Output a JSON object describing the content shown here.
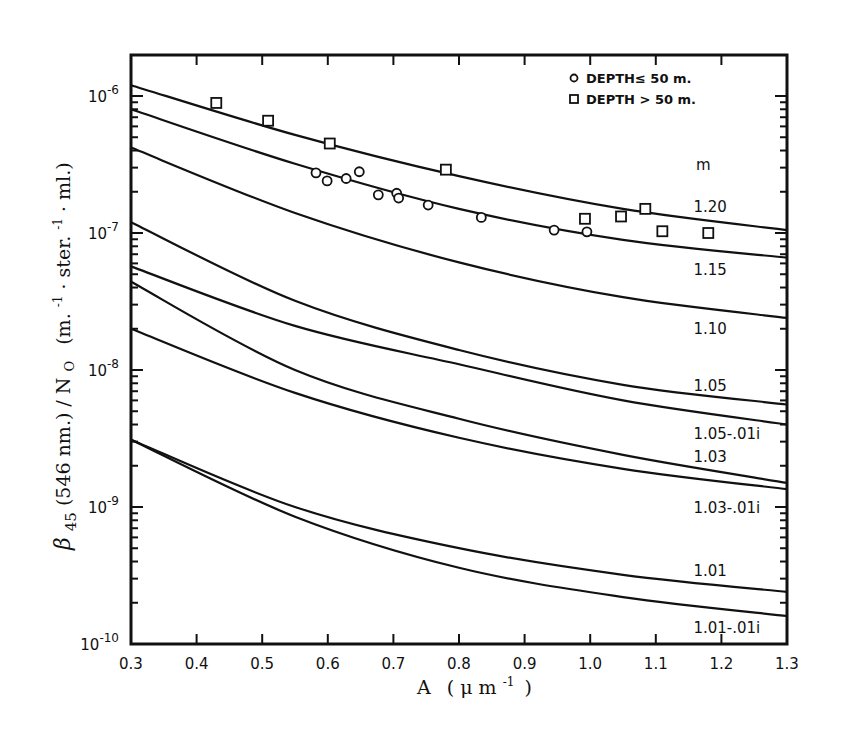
{
  "chart_data": {
    "type": "line",
    "title": "",
    "xlabel": "A (μm⁻¹)",
    "ylabel": "β₄₅(546nm.) / N₀ (m.⁻¹·ster.⁻¹·ml.)",
    "xlim": [
      0.3,
      1.3
    ],
    "ylim": [
      1e-10,
      2e-06
    ],
    "yscale": "log",
    "grid": false,
    "x_ticks": [
      "0.3",
      "0.4",
      "0.5",
      "0.6",
      "0.7",
      "0.8",
      "0.9",
      "1.0",
      "1.1",
      "1.2",
      "1.3"
    ],
    "y_ticks": [
      {
        "value": 1e-06,
        "label": "10",
        "exp": "-6"
      },
      {
        "value": 1e-07,
        "label": "10",
        "exp": "-7"
      },
      {
        "value": 1e-08,
        "label": "10",
        "exp": "-8"
      },
      {
        "value": 1e-09,
        "label": "10",
        "exp": "-9"
      },
      {
        "value": 1e-10,
        "label": "10",
        "exp": "-10"
      }
    ],
    "curve_group_label": "m",
    "series": [
      {
        "name": "1.20",
        "x": [
          0.3,
          0.55,
          0.8,
          1.05,
          1.3
        ],
        "values": [
          1.2e-06,
          5.2e-07,
          2.6e-07,
          1.5e-07,
          1.05e-07
        ],
        "label_pos": [
          1.2,
          1.55e-07
        ]
      },
      {
        "name": "1.15",
        "x": [
          0.3,
          0.55,
          0.8,
          1.05,
          1.3
        ],
        "values": [
          8e-07,
          3.2e-07,
          1.5e-07,
          8.9e-08,
          6.6e-08
        ],
        "label_pos": [
          1.2,
          5.4e-08
        ]
      },
      {
        "name": "1.10",
        "x": [
          0.3,
          0.55,
          0.8,
          1.05,
          1.3
        ],
        "values": [
          4.2e-07,
          1.4e-07,
          6.1e-08,
          3.4e-08,
          2.4e-08
        ],
        "label_pos": [
          1.2,
          2e-08
        ]
      },
      {
        "name": "1.05",
        "x": [
          0.3,
          0.55,
          0.8,
          1.05,
          1.3
        ],
        "values": [
          1.2e-07,
          3.2e-08,
          1.4e-08,
          7.8e-09,
          5.6e-09
        ],
        "label_pos": [
          1.2,
          7.7e-09
        ]
      },
      {
        "name": "1.05-.01i",
        "x": [
          0.3,
          0.55,
          0.8,
          1.05,
          1.3
        ],
        "values": [
          5.7e-08,
          2.1e-08,
          1.1e-08,
          6e-09,
          4e-09
        ],
        "label_pos": [
          1.2,
          3.4e-09
        ]
      },
      {
        "name": "1.03",
        "x": [
          0.3,
          0.55,
          0.8,
          1.05,
          1.3
        ],
        "values": [
          4.4e-08,
          1e-08,
          4.4e-09,
          2.4e-09,
          1.5e-09
        ],
        "label_pos": [
          1.2,
          2.3e-09
        ]
      },
      {
        "name": "1.03-.01i",
        "x": [
          0.3,
          0.55,
          0.8,
          1.05,
          1.3
        ],
        "values": [
          2e-08,
          6.8e-09,
          3.2e-09,
          1.9e-09,
          1.35e-09
        ],
        "label_pos": [
          1.2,
          9.8e-10
        ]
      },
      {
        "name": "1.01",
        "x": [
          0.3,
          0.55,
          0.8,
          1.05,
          1.3
        ],
        "values": [
          3.1e-09,
          1e-09,
          5e-10,
          3.2e-10,
          2.4e-10
        ],
        "label_pos": [
          1.2,
          3.4e-10
        ]
      },
      {
        "name": "1.01-.01i",
        "x": [
          0.3,
          0.55,
          0.8,
          1.05,
          1.3
        ],
        "values": [
          3.1e-09,
          8.5e-10,
          3.6e-10,
          2.2e-10,
          1.6e-10
        ],
        "label_pos": [
          1.2,
          1.3e-10
        ]
      }
    ],
    "scatter": [
      {
        "name": "DEPTH ≤ 50 m.",
        "marker": "circle",
        "points": [
          [
            0.582,
            2.75e-07
          ],
          [
            0.599,
            2.4e-07
          ],
          [
            0.628,
            2.5e-07
          ],
          [
            0.648,
            2.8e-07
          ],
          [
            0.677,
            1.9e-07
          ],
          [
            0.705,
            1.95e-07
          ],
          [
            0.708,
            1.8e-07
          ],
          [
            0.753,
            1.6e-07
          ],
          [
            0.834,
            1.3e-07
          ],
          [
            0.945,
            1.05e-07
          ],
          [
            0.995,
            1.02e-07
          ]
        ]
      },
      {
        "name": "DEPTH > 50 m.",
        "marker": "square",
        "points": [
          [
            0.43,
            8.9e-07
          ],
          [
            0.509,
            6.6e-07
          ],
          [
            0.603,
            4.5e-07
          ],
          [
            0.78,
            2.9e-07
          ],
          [
            0.992,
            1.27e-07
          ],
          [
            1.047,
            1.32e-07
          ],
          [
            1.084,
            1.5e-07
          ],
          [
            1.11,
            1.03e-07
          ],
          [
            1.18,
            1e-07
          ]
        ]
      }
    ],
    "legend": {
      "position": "upper right",
      "entries": [
        {
          "marker": "circle",
          "label": "DEPTH≤ 50 m."
        },
        {
          "marker": "square",
          "label": "DEPTH > 50 m."
        }
      ]
    }
  },
  "axes": {
    "x_title_main": "A",
    "x_title_unit": "( μ m",
    "x_title_exp": "-1",
    "x_title_close": ")",
    "y_title_beta": "β",
    "y_title_sub": "45",
    "y_title_rest": "(546 nm.) / N",
    "y_title_nsub": "O",
    "y_title_units": "(m.",
    "y_title_units_exp1": "-1",
    "y_title_units_mid": "· ster.",
    "y_title_units_exp2": "-1",
    "y_title_units_end": "· ml.)"
  }
}
